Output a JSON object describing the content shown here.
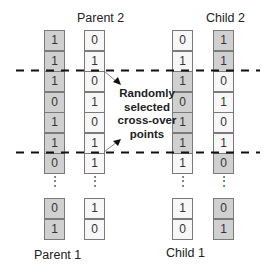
{
  "labels": {
    "parent1": "Parent 1",
    "parent2": "Parent 2",
    "child1": "Child 1",
    "child2": "Child 2",
    "annotation": [
      "Randomly",
      "selected",
      "cross-over",
      "points"
    ]
  },
  "ellipsis": "⋮",
  "colors": {
    "parent1_shade": "#d0d0d0",
    "parent2_shade": "#f7f7f7",
    "dashed_line": "#111111"
  },
  "crossover_points": {
    "after_row": [
      2,
      6
    ]
  },
  "columns": {
    "parent1": {
      "top": [
        "1",
        "1",
        "1",
        "0",
        "1",
        "1",
        "0"
      ],
      "bottom": [
        "0",
        "1"
      ],
      "top_shade": [
        "gray",
        "gray",
        "gray",
        "gray",
        "gray",
        "gray",
        "gray"
      ],
      "bottom_shade": [
        "gray",
        "gray"
      ]
    },
    "parent2": {
      "top": [
        "0",
        "1",
        "0",
        "1",
        "0",
        "1",
        "1"
      ],
      "bottom": [
        "1",
        "0"
      ],
      "top_shade": [
        "white",
        "white",
        "white",
        "white",
        "white",
        "white",
        "white"
      ],
      "bottom_shade": [
        "white",
        "white"
      ]
    },
    "child1": {
      "top": [
        "0",
        "1",
        "1",
        "0",
        "1",
        "1",
        "1"
      ],
      "bottom": [
        "1",
        "0"
      ],
      "top_shade": [
        "white",
        "white",
        "gray",
        "gray",
        "gray",
        "gray",
        "white"
      ],
      "bottom_shade": [
        "white",
        "white"
      ]
    },
    "child2": {
      "top": [
        "1",
        "1",
        "0",
        "1",
        "0",
        "1",
        "0"
      ],
      "bottom": [
        "0",
        "1"
      ],
      "top_shade": [
        "gray",
        "gray",
        "white",
        "white",
        "white",
        "white",
        "gray"
      ],
      "bottom_shade": [
        "gray",
        "gray"
      ]
    }
  }
}
